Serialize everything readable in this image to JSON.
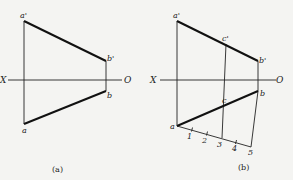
{
  "figure_a": {
    "caption": "(a)",
    "axis": {
      "left_label": "X",
      "right_label": "O"
    },
    "points": {
      "a_prime": {
        "label": "a'",
        "x": 24,
        "y": 21
      },
      "b_prime": {
        "label": "b'",
        "x": 106,
        "y": 61
      },
      "b": {
        "label": "b",
        "x": 106,
        "y": 91
      },
      "a": {
        "label": "a",
        "x": 24,
        "y": 124
      }
    }
  },
  "figure_b": {
    "caption": "(b)",
    "axis": {
      "left_label": "X",
      "right_label": "O"
    },
    "points": {
      "a_prime": {
        "label": "a'",
        "x": 177,
        "y": 21
      },
      "b_prime": {
        "label": "b'",
        "x": 258,
        "y": 61
      },
      "c_prime": {
        "label": "c'",
        "x": 226,
        "y": 44
      },
      "b": {
        "label": "b",
        "x": 258,
        "y": 91
      },
      "c": {
        "label": "c",
        "x": 226,
        "y": 104
      },
      "a": {
        "label": "a",
        "x": 177,
        "y": 126
      }
    },
    "division_marks": [
      "1",
      "2",
      "3",
      "4",
      "5"
    ]
  }
}
